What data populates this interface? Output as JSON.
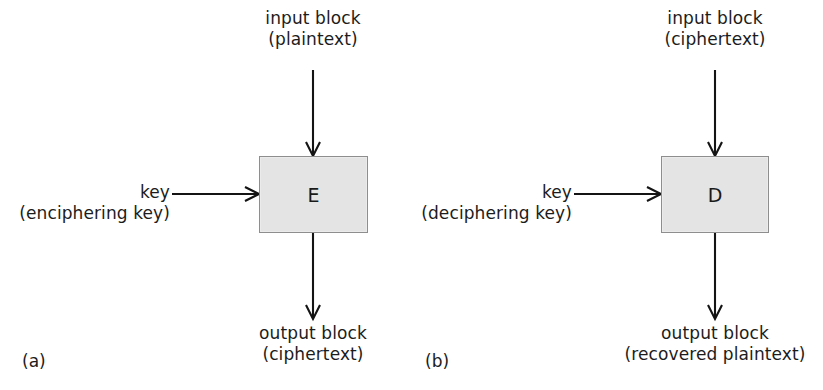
{
  "figure": {
    "background_color": "#ffffff",
    "box_fill_color": "#e4e4e4",
    "box_border_color": "#8e8e8e",
    "line_color": "#141414",
    "text_color": "#1c1c1c"
  },
  "panels": [
    {
      "tag": "(a)",
      "input_line1": "input block",
      "input_line2": "(plaintext)",
      "key_line1": "key",
      "key_line2": "(enciphering key)",
      "box_letter": "E",
      "output_line1": "output block",
      "output_line2": "(ciphertext)"
    },
    {
      "tag": "(b)",
      "input_line1": "input block",
      "input_line2": "(ciphertext)",
      "key_line1": "key",
      "key_line2": "(deciphering key)",
      "box_letter": "D",
      "output_line1": "output block",
      "output_line2": "(recovered plaintext)"
    }
  ]
}
